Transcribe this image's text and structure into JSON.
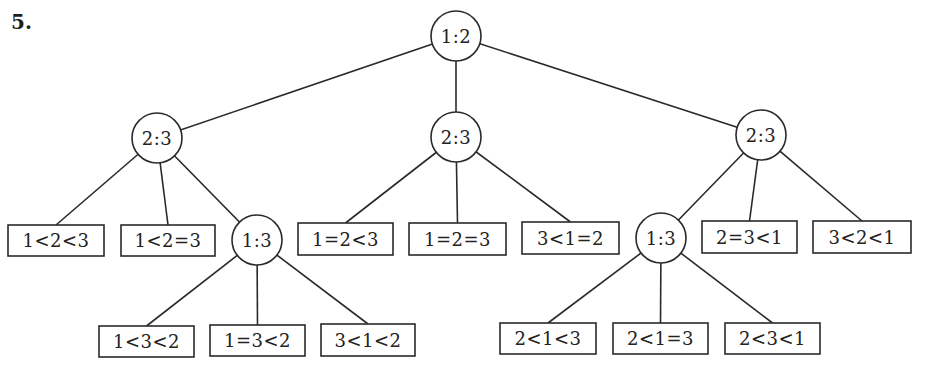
{
  "exercise": {
    "number": "5."
  },
  "tree": {
    "comparisons": [
      {
        "id": "root",
        "label": "1:2",
        "cx": 456,
        "cy": 36,
        "r": 25
      },
      {
        "id": "left",
        "label": "2:3",
        "cx": 157,
        "cy": 138,
        "r": 25
      },
      {
        "id": "middle",
        "label": "2:3",
        "cx": 456,
        "cy": 137,
        "r": 25
      },
      {
        "id": "right",
        "label": "2:3",
        "cx": 761,
        "cy": 135,
        "r": 25
      },
      {
        "id": "left-sub",
        "label": "1:3",
        "cx": 257,
        "cy": 240,
        "r": 25
      },
      {
        "id": "right-sub",
        "label": "1:3",
        "cx": 661,
        "cy": 238,
        "r": 25
      }
    ],
    "outcomes": [
      {
        "id": "o1",
        "label": "1<2<3",
        "x": 8,
        "y": 225,
        "w": 96,
        "h": 31,
        "parent": "left"
      },
      {
        "id": "o2",
        "label": "1<2=3",
        "x": 121,
        "y": 225,
        "w": 94,
        "h": 31,
        "parent": "left"
      },
      {
        "id": "o3",
        "label": "1=2<3",
        "x": 298,
        "y": 223,
        "w": 95,
        "h": 32,
        "parent": "middle"
      },
      {
        "id": "o4",
        "label": "1=2=3",
        "x": 409,
        "y": 223,
        "w": 97,
        "h": 32,
        "parent": "middle"
      },
      {
        "id": "o5",
        "label": "3<1=2",
        "x": 522,
        "y": 222,
        "w": 97,
        "h": 32,
        "parent": "middle"
      },
      {
        "id": "o6",
        "label": "2=3<1",
        "x": 702,
        "y": 221,
        "w": 95,
        "h": 32,
        "parent": "right"
      },
      {
        "id": "o7",
        "label": "3<2<1",
        "x": 813,
        "y": 221,
        "w": 98,
        "h": 32,
        "parent": "right"
      },
      {
        "id": "o8",
        "label": "1<3<2",
        "x": 99,
        "y": 326,
        "w": 95,
        "h": 31,
        "parent": "left-sub"
      },
      {
        "id": "o9",
        "label": "1=3<2",
        "x": 210,
        "y": 325,
        "w": 95,
        "h": 31,
        "parent": "left-sub"
      },
      {
        "id": "o10",
        "label": "3<1<2",
        "x": 321,
        "y": 324,
        "w": 94,
        "h": 32,
        "parent": "left-sub"
      },
      {
        "id": "o11",
        "label": "2<1<3",
        "x": 500,
        "y": 323,
        "w": 96,
        "h": 31,
        "parent": "right-sub"
      },
      {
        "id": "o12",
        "label": "2<1=3",
        "x": 613,
        "y": 323,
        "w": 95,
        "h": 31,
        "parent": "right-sub"
      },
      {
        "id": "o13",
        "label": "2<3<1",
        "x": 725,
        "y": 323,
        "w": 95,
        "h": 31,
        "parent": "right-sub"
      }
    ],
    "edges": [
      {
        "from": "root",
        "to": "left"
      },
      {
        "from": "root",
        "to": "middle"
      },
      {
        "from": "root",
        "to": "right"
      },
      {
        "from": "left",
        "to": "o1"
      },
      {
        "from": "left",
        "to": "o2"
      },
      {
        "from": "left",
        "to": "left-sub"
      },
      {
        "from": "middle",
        "to": "o3"
      },
      {
        "from": "middle",
        "to": "o4"
      },
      {
        "from": "middle",
        "to": "o5"
      },
      {
        "from": "right",
        "to": "right-sub"
      },
      {
        "from": "right",
        "to": "o6"
      },
      {
        "from": "right",
        "to": "o7"
      },
      {
        "from": "left-sub",
        "to": "o8"
      },
      {
        "from": "left-sub",
        "to": "o9"
      },
      {
        "from": "left-sub",
        "to": "o10"
      },
      {
        "from": "right-sub",
        "to": "o11"
      },
      {
        "from": "right-sub",
        "to": "o12"
      },
      {
        "from": "right-sub",
        "to": "o13"
      }
    ]
  }
}
